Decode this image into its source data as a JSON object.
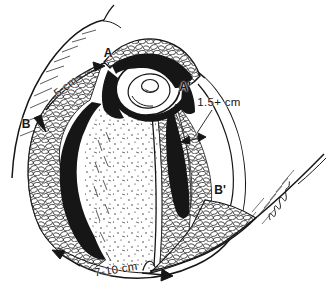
{
  "illustration": {
    "kind": "surgical stump flap line drawing",
    "background_color": "#ffffff",
    "ink_color": "#161616",
    "points": {
      "a": "A",
      "a_prime": "A'",
      "b": "B",
      "b_prime": "B'"
    },
    "measurements": {
      "upper_flap_edge": "5 cm",
      "posterior_rim": "1.5+ cm",
      "base_width": "7-10 cm"
    }
  }
}
